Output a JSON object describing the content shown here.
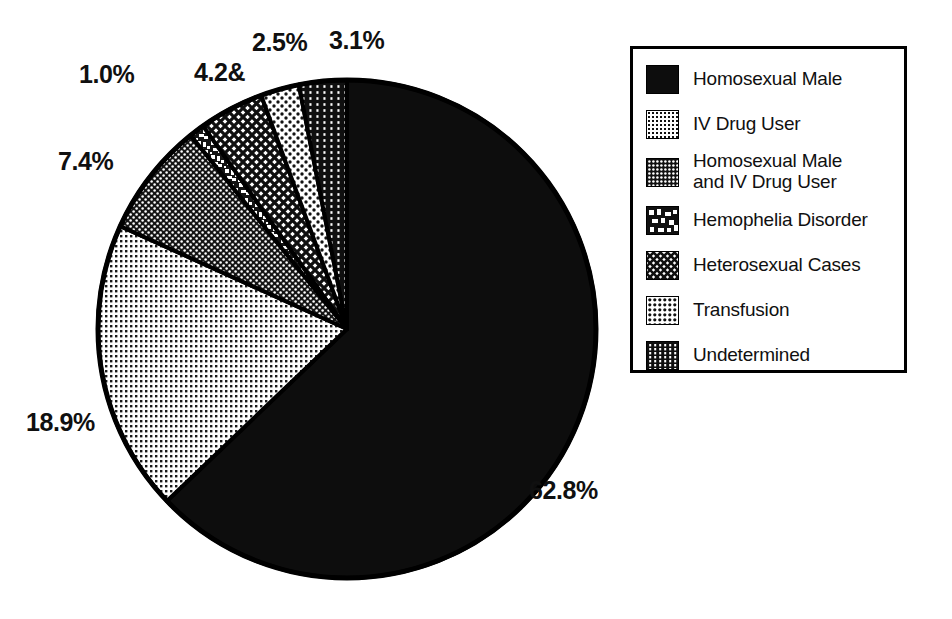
{
  "chart_data": {
    "type": "pie",
    "title": "",
    "subtitle": "",
    "xlabel": "",
    "ylabel": "",
    "legend_position": "top-right",
    "grid": false,
    "start_angle_deg": 0,
    "direction": "clockwise",
    "categories": [
      "Homosexual Male",
      "IV Drug User",
      "Homosexual Male and IV Drug User",
      "Hemophelia Disorder",
      "Heterosexual Cases",
      "Transfusion",
      "Undetermined"
    ],
    "values": [
      62.8,
      18.9,
      7.4,
      1.0,
      4.2,
      2.5,
      3.1
    ],
    "data_labels": [
      "62.8%",
      "18.9%",
      "7.4%",
      "1.0%",
      "4.2&",
      "2.5%",
      "3.1%"
    ],
    "units": "percent",
    "slices": [
      {
        "label": "Homosexual Male",
        "value": 62.8,
        "data_label": "62.8%",
        "pattern": "solid-black",
        "fill": "#0d0d0d"
      },
      {
        "label": "IV Drug User",
        "value": 18.9,
        "data_label": "18.9%",
        "pattern": "fine-light-dots",
        "fill": "#d8d8d8"
      },
      {
        "label": "Homosexual Male and IV Drug User",
        "value": 7.4,
        "data_label": "7.4%",
        "pattern": "dark-dot-grid",
        "fill": "#3a3a3a"
      },
      {
        "label": "Hemophelia Disorder",
        "value": 1.0,
        "data_label": "1.0%",
        "pattern": "irregular-blob",
        "fill": "#8a8a8a"
      },
      {
        "label": "Heterosexual Cases",
        "value": 4.2,
        "data_label": "4.2&",
        "pattern": "diagonal-crosshatch",
        "fill": "#6e6e6e"
      },
      {
        "label": "Transfusion",
        "value": 2.5,
        "data_label": "2.5%",
        "pattern": "sparse-light-dots",
        "fill": "#e2e2e2"
      },
      {
        "label": "Undetermined",
        "value": 3.1,
        "data_label": "3.1%",
        "pattern": "dark-vertical-dots",
        "fill": "#2a2a2a"
      }
    ]
  },
  "legend": {
    "items": [
      {
        "label": "Homosexual Male",
        "pattern": "solid-black"
      },
      {
        "label": "IV Drug User",
        "pattern": "fine-light-dots"
      },
      {
        "label": "Homosexual Male\nand IV Drug User",
        "pattern": "dark-dot-grid"
      },
      {
        "label": "Hemophelia Disorder",
        "pattern": "irregular-blob"
      },
      {
        "label": "Heterosexual Cases",
        "pattern": "diagonal-crosshatch"
      },
      {
        "label": "Transfusion",
        "pattern": "sparse-light-dots"
      },
      {
        "label": "Undetermined",
        "pattern": "dark-vertical-dots"
      }
    ]
  },
  "colors": {
    "ink": "#000000",
    "paper": "#ffffff",
    "solid_black": "#0d0d0d",
    "light_dots": "#d8d8d8",
    "dark_dots": "#3a3a3a",
    "mid_gray": "#8a8a8a"
  }
}
